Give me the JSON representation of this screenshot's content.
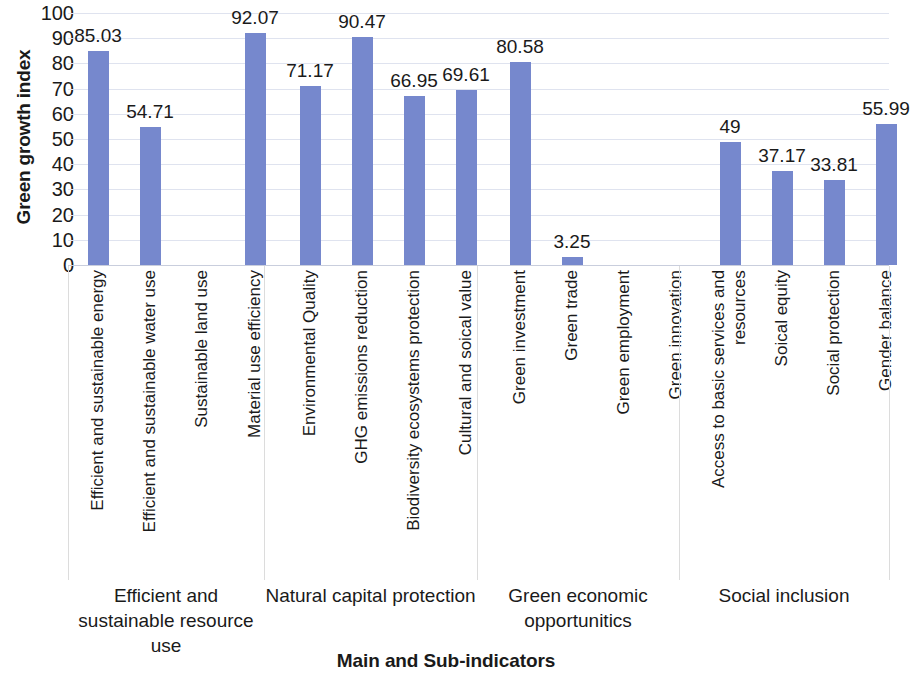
{
  "chart_data": {
    "type": "bar",
    "title": "",
    "xlabel": "Main and Sub-indicators",
    "ylabel": "Green growth index",
    "ylim": [
      0,
      100
    ],
    "ytick_step": 10,
    "grid": true,
    "legend": "none",
    "bar_color": "#7688cd",
    "categories": [
      "Efficient and sustainable energy",
      "Efficient and sustainable water use",
      "Sustainable land use",
      "Material use efficiency",
      "Environmental Quality",
      "GHG emissions reduction",
      "Biodiversity ecosystems protection",
      "Cultural and soical value",
      "Green investment",
      "Green trade",
      "Green employment",
      "Green innovation",
      "Access to basic services and resources",
      "Soical equity",
      "Social protection",
      "Gender balance"
    ],
    "values": [
      85.03,
      54.71,
      null,
      92.07,
      71.17,
      90.47,
      66.95,
      69.61,
      80.58,
      3.25,
      null,
      null,
      49,
      37.17,
      33.81,
      55.99
    ],
    "value_labels": [
      "85.03",
      "54.71",
      "",
      "92.07",
      "71.17",
      "90.47",
      "66.95",
      "69.61",
      "80.58",
      "3.25",
      "",
      "",
      "49",
      "37.17",
      "33.81",
      "55.99"
    ],
    "ytick_labels": [
      "100",
      "90",
      "80",
      "70",
      "60",
      "50",
      "40",
      "30",
      "20",
      "10",
      "0"
    ],
    "groups": [
      {
        "label": "Efficient and sustainable resource use",
        "start": 0,
        "end": 3
      },
      {
        "label": "Natural capital protection",
        "start": 4,
        "end": 7
      },
      {
        "label": "Green economic opportunitics",
        "start": 8,
        "end": 11
      },
      {
        "label": "Social inclusion",
        "start": 12,
        "end": 15
      }
    ]
  }
}
